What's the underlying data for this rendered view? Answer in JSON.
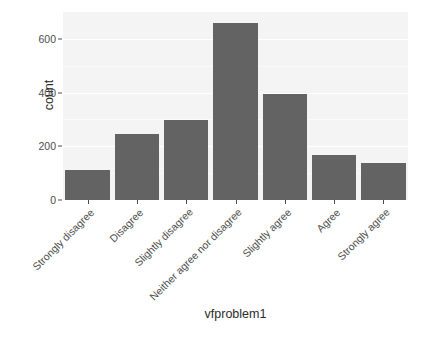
{
  "chart_data": {
    "type": "bar",
    "title": "",
    "subtitle": "",
    "xlabel": "vfproblem1",
    "ylabel": "count",
    "categories": [
      "Strongly disagree",
      "Disagree",
      "Slightly disagree",
      "Neither agree nor disagree",
      "Slightly agree",
      "Agree",
      "Strongly agree"
    ],
    "values": [
      111,
      244,
      297,
      659,
      396,
      166,
      137
    ],
    "ylim": [
      0,
      700
    ],
    "xlim_categorical": true,
    "yticks": [
      0,
      200,
      400,
      600
    ],
    "ytick_labels": [
      "0",
      "200",
      "400",
      "600"
    ],
    "grid": true,
    "grid_major_y": [
      0,
      200,
      400,
      600
    ],
    "grid_minor_y": [
      100,
      300,
      500
    ],
    "legend": null,
    "legend_position": "none",
    "bar_color": "#636363",
    "panel_background": "#f4f4f4",
    "grid_color": "#ffffff",
    "axis_text_color": "#4d4d4d",
    "axis_title_color": "#2b2b2b",
    "plot_background": "#ffffff",
    "xtick_label_rotation": -45,
    "bar_width_ratio": 0.9
  }
}
